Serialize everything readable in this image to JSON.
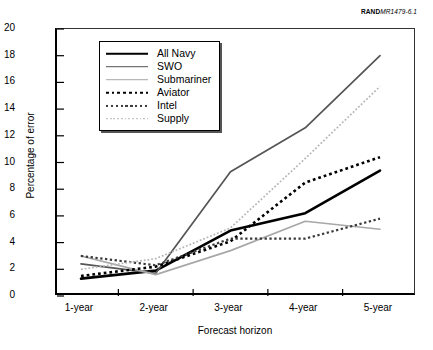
{
  "source_note": {
    "prefix": "RAND",
    "code": "MR1479-6.1"
  },
  "chart_data": {
    "type": "line",
    "title": "",
    "xlabel": "Forecast horizon",
    "ylabel": "Percentage of error",
    "categories": [
      "1-year",
      "2-year",
      "3-year",
      "4-year",
      "5-year"
    ],
    "ylim": [
      0,
      20
    ],
    "ytick_step": 2,
    "yticks": [
      "20",
      "18",
      "16",
      "14",
      "12",
      "10",
      "8",
      "6",
      "4",
      "2",
      "0"
    ],
    "grid": false,
    "legend_position": "upper-left inside",
    "series": [
      {
        "name": "All Navy",
        "values": [
          1.3,
          1.9,
          4.9,
          6.2,
          9.4
        ],
        "color": "#000000",
        "style": "solid",
        "width": 2.6
      },
      {
        "name": "SWO",
        "values": [
          2.4,
          1.7,
          9.3,
          12.6,
          18.0
        ],
        "color": "#555555",
        "style": "solid",
        "width": 1.7
      },
      {
        "name": "Submariner",
        "values": [
          3.0,
          1.6,
          3.4,
          5.6,
          5.0
        ],
        "color": "#a8a8a8",
        "style": "solid",
        "width": 1.7
      },
      {
        "name": "Aviator",
        "values": [
          1.5,
          2.2,
          4.1,
          8.5,
          10.4
        ],
        "color": "#000000",
        "style": "dotted",
        "width": 2.6
      },
      {
        "name": "Intel",
        "values": [
          3.0,
          2.3,
          4.3,
          4.3,
          5.8
        ],
        "color": "#3a3a3a",
        "style": "dotted",
        "width": 2.2
      },
      {
        "name": "Supply",
        "values": [
          2.0,
          2.8,
          5.1,
          10.3,
          15.7
        ],
        "color": "#b5b5b5",
        "style": "dotted",
        "width": 1.7
      }
    ]
  }
}
